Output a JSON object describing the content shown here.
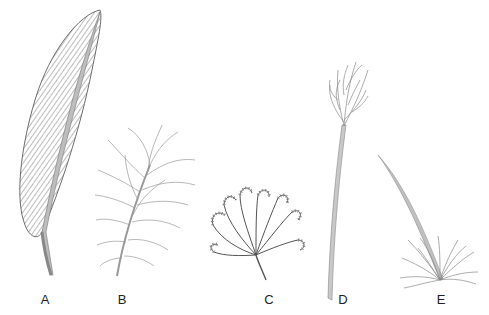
{
  "figure": {
    "items": [
      {
        "id": "A",
        "label": "A",
        "kind": "contour-feather"
      },
      {
        "id": "B",
        "label": "B",
        "kind": "downy-plume-feather"
      },
      {
        "id": "C",
        "label": "C",
        "kind": "curled-branching-plume"
      },
      {
        "id": "D",
        "label": "D",
        "kind": "long-shafted-tufted-plume"
      },
      {
        "id": "E",
        "label": "E",
        "kind": "bristle-tuft-with-long-shaft"
      }
    ]
  },
  "colors": {
    "line": "#6e6e6e",
    "fill_dark": "#8a8a8a",
    "fill_light": "#c8c8c8",
    "label": "#222222"
  }
}
